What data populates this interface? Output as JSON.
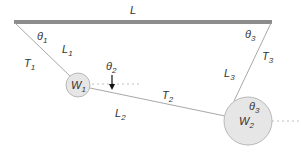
{
  "diagram": {
    "type": "mechanics-free-body",
    "ceiling": {
      "label": "L",
      "x1": 14,
      "y1": 22,
      "x2": 272,
      "y2": 22,
      "color": "#8c8c8c"
    },
    "weights": [
      {
        "id": "W1",
        "label": "W",
        "sub": "1",
        "cx": 78,
        "cy": 85,
        "r": 12
      },
      {
        "id": "W2",
        "label": "W",
        "sub": "2",
        "cx": 248,
        "cy": 121,
        "r": 24
      }
    ],
    "segments": [
      {
        "id": "L1",
        "label": "L",
        "sub": "1",
        "tension": "T",
        "tension_sub": "1"
      },
      {
        "id": "L2",
        "label": "L",
        "sub": "2",
        "tension": "T",
        "tension_sub": "2"
      },
      {
        "id": "L3",
        "label": "L",
        "sub": "3",
        "tension": "T",
        "tension_sub": "3"
      }
    ],
    "angles": [
      {
        "label": "θ",
        "sub": "1"
      },
      {
        "label": "θ",
        "sub": "2"
      },
      {
        "label": "θ",
        "sub": "3"
      },
      {
        "label": "θ",
        "sub": "3"
      }
    ],
    "colors": {
      "bar": "#8c8c8c",
      "string": "#a8a8a8",
      "weight_fill": "#e6e6e6",
      "weight_stroke": "#b8b8b8",
      "dotted": "#c0c0c0",
      "arrow": "#111111",
      "text": "#333333"
    }
  }
}
